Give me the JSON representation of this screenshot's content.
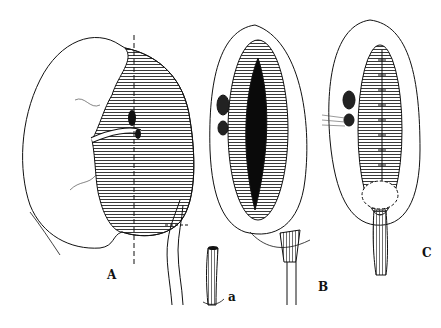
{
  "figure": {
    "panels": [
      {
        "id": "A",
        "label": "A",
        "description": "Kidney with hatched dilated renal pelvis, dashed vertical incision line, vessels and ureter"
      },
      {
        "id": "a",
        "label": "a",
        "description": "Spatulated ureter segment detail"
      },
      {
        "id": "B",
        "label": "B",
        "description": "Opened renal pelvis (dark lumen) with ureter"
      },
      {
        "id": "C",
        "label": "C",
        "description": "Sutured pelvis reconstruction with ureteral anastomosis"
      }
    ],
    "colors": {
      "line": "#111111",
      "fill_dark": "#0a0a0a",
      "background": "#ffffff"
    }
  }
}
